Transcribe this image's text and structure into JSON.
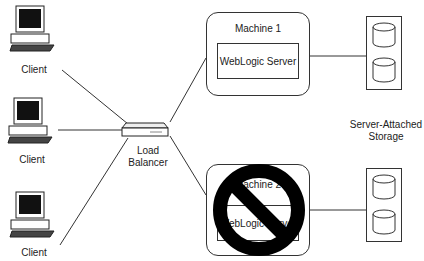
{
  "diagram": {
    "clients": [
      {
        "label": "Client"
      },
      {
        "label": "Client"
      },
      {
        "label": "Client"
      }
    ],
    "load_balancer": {
      "label_line1": "Load",
      "label_line2": "Balancer"
    },
    "machines": [
      {
        "title": "Machine 1",
        "server": "WebLogic Server",
        "status": "active"
      },
      {
        "title": "Machine 2",
        "server": "WebLogic Server",
        "status": "failed",
        "overlay_icon": "prohibited-icon"
      }
    ],
    "storage": {
      "label_line1": "Server-Attached",
      "label_line2": "Storage",
      "units": 2,
      "disks_per_unit": 2
    },
    "colors": {
      "stroke": "#333333",
      "prohibit": "#000000",
      "background": "#ffffff"
    }
  }
}
